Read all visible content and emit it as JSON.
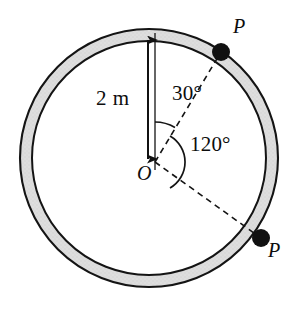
{
  "figure": {
    "background_color": "#ffffff",
    "ring": {
      "name": "circular-ring-band",
      "center_x": 149,
      "center_y": 158,
      "outer_radius": 129,
      "inner_radius": 117,
      "fill_color": "#dcdcdc",
      "stroke_color": "#111111",
      "stroke_width": 2
    },
    "center_point": {
      "label": "O",
      "x": 155,
      "y": 162
    },
    "radius_dimension": {
      "label": "2 m",
      "value": 2,
      "unit": "m",
      "arrow_x": 148,
      "arrow_top_y": 38,
      "arrow_bottom_y": 161,
      "color": "#111111"
    },
    "reference_line": {
      "name": "vertical-reference-line",
      "x": 155,
      "top_y": 33,
      "bottom_y": 168,
      "color": "#111111"
    },
    "angles": [
      {
        "id": "angle-30",
        "label": "30°",
        "value": 30,
        "unit": "degrees",
        "from_deg": 0,
        "to_deg": 30,
        "arc_radius": 40
      },
      {
        "id": "angle-120",
        "label": "120°",
        "value": 120,
        "unit": "degrees",
        "from_deg": 30,
        "to_deg": 150,
        "arc_radius": 30
      }
    ],
    "points": [
      {
        "id": "point-p-top",
        "label": "P",
        "angle_from_vertical_deg": 30,
        "x": 221,
        "y": 52,
        "dot_radius": 9,
        "dot_color": "#111111"
      },
      {
        "id": "point-p-bottom",
        "label": "P",
        "angle_from_vertical_deg": 150,
        "x": 260,
        "y": 237,
        "dot_radius": 9,
        "dot_color": "#111111"
      }
    ],
    "dashed_lines": [
      {
        "id": "radius-line-to-p-top",
        "from": "O",
        "to": "point-p-top",
        "style": "dashed",
        "color": "#111111"
      },
      {
        "id": "radius-line-to-p-bottom",
        "from": "O",
        "to": "point-p-bottom",
        "style": "dashed",
        "color": "#111111"
      }
    ]
  }
}
